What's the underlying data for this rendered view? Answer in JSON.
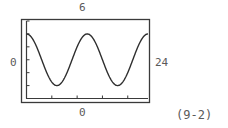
{
  "labels": {
    "top": "6",
    "left": "0",
    "right": "24",
    "bottom": "0",
    "figure_id": "(9-2)"
  },
  "chart_data": {
    "type": "line",
    "title": "",
    "xlabel": "",
    "ylabel": "",
    "xlim": [
      0,
      24
    ],
    "ylim": [
      0,
      6
    ],
    "window_labels": {
      "ymax": "6",
      "xmin": "0",
      "xmax": "24",
      "ymin": "0"
    },
    "grid": false,
    "legend": null,
    "y_ticks_count": 6,
    "x_ticks_count": 4,
    "series": [
      {
        "name": "curve",
        "description": "periodic cosine-like wave, two full cycles across window; peaks at x=0, 12, 24, troughs at x=6, 18",
        "x": [
          0,
          1.5,
          3,
          4.5,
          6,
          7.5,
          9,
          10.5,
          12,
          13.5,
          15,
          16.5,
          18,
          19.5,
          21,
          22.5,
          24
        ],
        "y": [
          5,
          4.7,
          4.0,
          3.3,
          1,
          1.3,
          2.0,
          4.7,
          5,
          4.7,
          4.0,
          1.3,
          1,
          1.3,
          3.0,
          4.7,
          5
        ]
      }
    ]
  }
}
